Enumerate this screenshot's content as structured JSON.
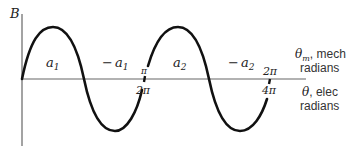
{
  "diagram": {
    "y_axis_label": "B",
    "regions": [
      {
        "label": "a",
        "sub": "1",
        "sign": ""
      },
      {
        "label": "a",
        "sub": "1",
        "sign": "−"
      },
      {
        "label": "a",
        "sub": "2",
        "sign": ""
      },
      {
        "label": "a",
        "sub": "2",
        "sign": "−"
      }
    ],
    "ticks": [
      {
        "mech": "π",
        "elec": "2π"
      },
      {
        "mech": "2π",
        "elec": "4π"
      }
    ],
    "x_axis_labels": {
      "mech_symbol": "θ",
      "mech_sub": "m",
      "mech_text": ", mech",
      "mech_unit": "radians",
      "elec_symbol": "θ",
      "elec_text": ", elec",
      "elec_unit": "radians"
    },
    "colors": {
      "curve": "#111111",
      "axis": "#666666"
    }
  }
}
